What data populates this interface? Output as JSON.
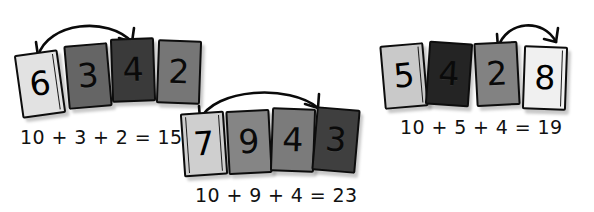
{
  "page": {
    "background_color": "#ffffff",
    "width": 594,
    "height": 212
  },
  "palette": {
    "light": "#e2e2e2",
    "lightest": "#f2f2f2",
    "mid_light": "#c6c6c6",
    "mid": "#9a9a9a",
    "mid_dark": "#7d7d7d",
    "dark": "#4a4a4a",
    "darkest": "#2a2a2a",
    "ink": "#111111",
    "card_border": "#0d0d0d"
  },
  "groups": [
    {
      "id": "group-1",
      "equation": "10 + 3 + 2 = 15",
      "arrow": {
        "name": "make-ten-arrow",
        "direction": "double-headed",
        "from_card": "6",
        "to_card": "4"
      },
      "cards": [
        {
          "value": "6",
          "shade": "light",
          "tilt": -8,
          "binder": true,
          "binder_side": "right"
        },
        {
          "value": "3",
          "shade": "dark",
          "tilt": -5,
          "binder": false,
          "binder_side": "none"
        },
        {
          "value": "4",
          "shade": "darkest",
          "tilt": -2,
          "binder": false,
          "binder_side": "none"
        },
        {
          "value": "2",
          "shade": "dark",
          "tilt": 2,
          "binder": false,
          "binder_side": "none"
        }
      ]
    },
    {
      "id": "group-2",
      "equation": "10 + 9 + 4 = 23",
      "arrow": {
        "name": "make-ten-arrow",
        "direction": "double-headed",
        "from_card": "7",
        "to_card": "3"
      },
      "cards": [
        {
          "value": "7",
          "shade": "mid_light",
          "tilt": -4,
          "binder": true,
          "binder_side": "left"
        },
        {
          "value": "9",
          "shade": "mid_dark",
          "tilt": -3,
          "binder": false,
          "binder_side": "none"
        },
        {
          "value": "4",
          "shade": "mid_dark",
          "tilt": 2,
          "binder": false,
          "binder_side": "none"
        },
        {
          "value": "3",
          "shade": "darkest",
          "tilt": 5,
          "binder": false,
          "binder_side": "none"
        }
      ]
    },
    {
      "id": "group-3",
      "equation": "10 + 5 + 4 = 19",
      "arrow": {
        "name": "make-ten-arrow",
        "direction": "double-headed",
        "from_card": "2",
        "to_card": "8"
      },
      "cards": [
        {
          "value": "5",
          "shade": "mid_light",
          "tilt": -5,
          "binder": true,
          "binder_side": "right"
        },
        {
          "value": "4",
          "shade": "darkest",
          "tilt": 4,
          "binder": false,
          "binder_side": "none"
        },
        {
          "value": "2",
          "shade": "mid_dark",
          "tilt": -3,
          "binder": false,
          "binder_side": "none"
        },
        {
          "value": "8",
          "shade": "lightest",
          "tilt": 2,
          "binder": true,
          "binder_side": "right"
        }
      ]
    }
  ]
}
